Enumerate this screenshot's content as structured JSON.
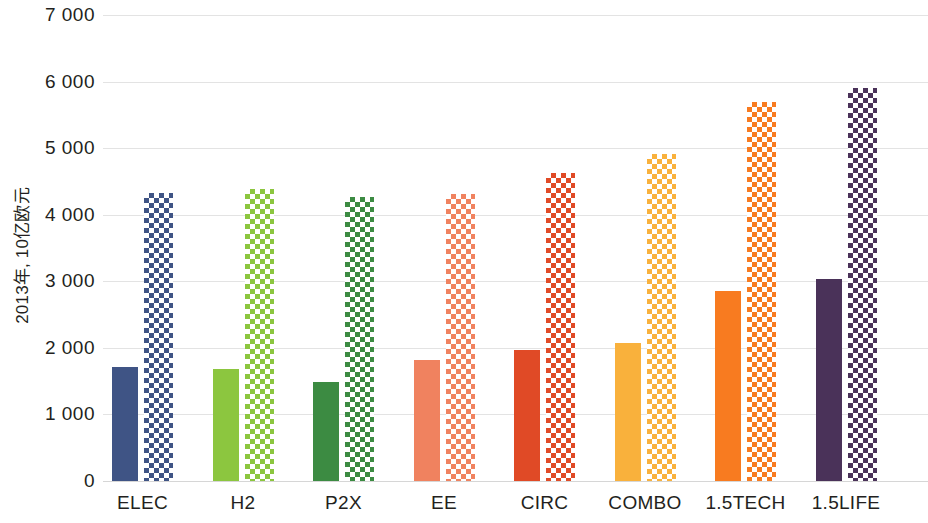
{
  "chart_data": {
    "type": "bar",
    "title": "",
    "subtitle": "",
    "xlabel": "",
    "ylabel": "2013年, 10亿欧元",
    "ylim": [
      0,
      7000
    ],
    "ytick_values": [
      0,
      1000,
      2000,
      3000,
      4000,
      5000,
      6000,
      7000
    ],
    "ytick_labels": [
      "0",
      "1 000",
      "2 000",
      "3 000",
      "4 000",
      "5 000",
      "6 000",
      "7 000"
    ],
    "grid": true,
    "legend": "none",
    "categories": [
      "ELEC",
      "H2",
      "P2X",
      "EE",
      "CIRC",
      "COMBO",
      "1.5TECH",
      "1.5LIFE"
    ],
    "series": [
      {
        "name": "solid",
        "fill": "solid",
        "values": [
          1720,
          1690,
          1480,
          1820,
          1970,
          2080,
          2850,
          3030
        ]
      },
      {
        "name": "hatched",
        "fill": "checkered",
        "values": [
          4320,
          4390,
          4270,
          4310,
          4630,
          4910,
          5700,
          5900
        ]
      }
    ],
    "category_colors": {
      "ELEC": "#3f5485",
      "H2": "#8cc63f",
      "P2X": "#3c8b42",
      "EE": "#f0825f",
      "CIRC": "#e04a26",
      "COMBO": "#f9b13c",
      "1.5TECH": "#f87b20",
      "1.5LIFE": "#4a3259"
    },
    "style": {
      "background": "#ffffff",
      "gridline_color": "#e3e3e3",
      "baseline_color": "#d6d6d6",
      "text_color": "#231f20"
    }
  }
}
